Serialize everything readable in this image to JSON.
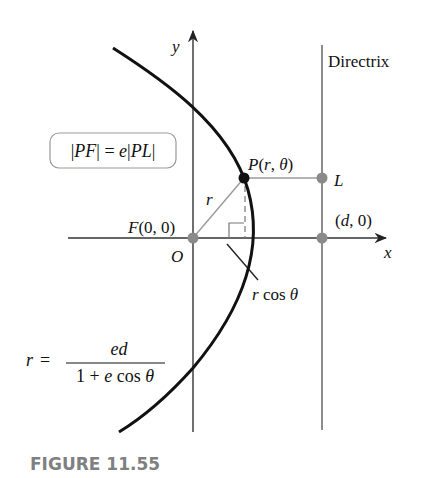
{
  "figure": {
    "caption": "FIGURE 11.55",
    "colors": {
      "curve": "#111111",
      "axes": "#333333",
      "directrix": "#8c8c8c",
      "guide_lines": "#9a9a9a",
      "points_gray": "#8a8a8a",
      "point_P": "#111111",
      "caption": "#808080",
      "box_border": "#999999"
    },
    "axes": {
      "x_label": "x",
      "y_label": "y",
      "origin_label": "O"
    },
    "labels": {
      "directrix": "Directrix",
      "focus": "F(0, 0)",
      "point_P": "P(r, θ)",
      "point_L": "L",
      "point_d": "(d, 0)",
      "radius": "r",
      "projection": "r cos θ"
    },
    "equations": {
      "definition": "|PF| = e|PL|",
      "polar_r": "r",
      "polar_equals": "=",
      "polar_numerator": "ed",
      "polar_denominator": "1 + e cos θ"
    }
  }
}
